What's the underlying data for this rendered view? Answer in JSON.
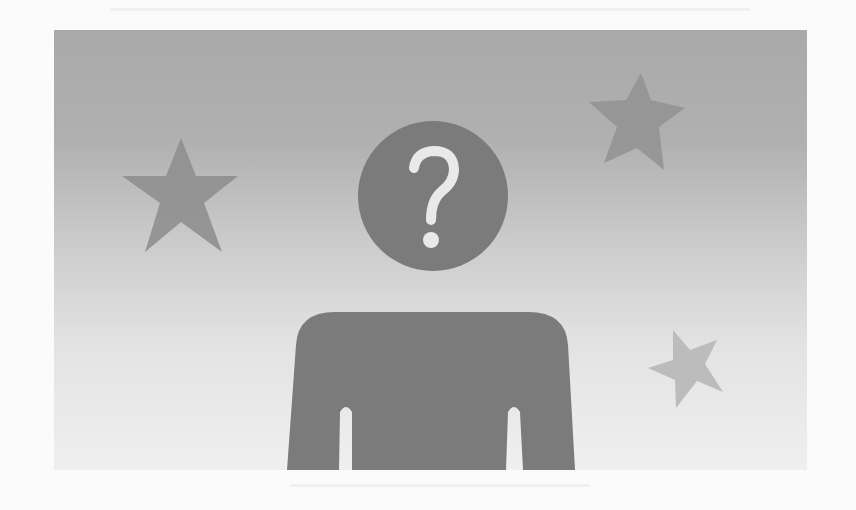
{
  "figure": {
    "colors": {
      "background_top": "#a9a9a9",
      "background_bottom": "#efefef",
      "silhouette": "#7b7b7b",
      "question_mark": "#e9e9e9",
      "star_left": "#8f8f8f",
      "star_top_right": "#939393",
      "star_small": "#bcbcbc"
    },
    "head_glyph": "?",
    "elements": [
      {
        "name": "head",
        "shape": "circle"
      },
      {
        "name": "question-mark",
        "shape": "glyph"
      },
      {
        "name": "torso",
        "shape": "shoulders-with-arms"
      },
      {
        "name": "star-left",
        "shape": "star"
      },
      {
        "name": "star-top-right",
        "shape": "star"
      },
      {
        "name": "star-small-right",
        "shape": "star"
      }
    ]
  }
}
